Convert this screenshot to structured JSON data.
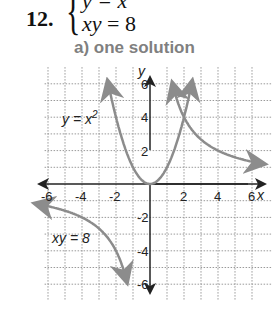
{
  "problem": {
    "number": "12.",
    "equation_1": "y = x",
    "equation_2_var": "xy",
    "equation_2_rest": " = 8",
    "answer": "a) one solution"
  },
  "chart_data": {
    "type": "line",
    "title": "a) one solution",
    "xlabel": "x",
    "ylabel": "y",
    "xlim": [
      -6,
      6
    ],
    "ylim": [
      -6,
      6
    ],
    "grid": true,
    "x_ticks": [
      "-6",
      "-4",
      "-2",
      "2",
      "4",
      "6"
    ],
    "y_ticks": [
      "6",
      "4",
      "2",
      "-2",
      "-4",
      "-6"
    ],
    "series": [
      {
        "name": "y = x²",
        "label": "y = x",
        "superscript": "2",
        "function": "y = x^2",
        "color": "#8c8c8c",
        "x": [
          -2.45,
          -2,
          -1,
          0,
          1,
          2,
          2.45
        ],
        "y": [
          6,
          4,
          1,
          0,
          1,
          4,
          6
        ]
      },
      {
        "name": "xy = 8",
        "label": "xy = 8",
        "function": "y = 8/x",
        "color": "#8c8c8c",
        "branches": [
          {
            "x": [
              1.33,
              2,
              4,
              6.5
            ],
            "y": [
              6,
              4,
              2,
              1.23
            ]
          },
          {
            "x": [
              -6.5,
              -4,
              -2,
              -1.33
            ],
            "y": [
              -1.23,
              -2,
              -4,
              -6
            ]
          }
        ]
      }
    ],
    "intersections": [
      {
        "x": 2,
        "y": 4
      }
    ]
  }
}
